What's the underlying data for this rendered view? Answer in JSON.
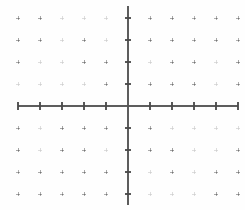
{
  "document": {
    "title": "Blank Cartesian Coordinate Grid",
    "kind": "coordinate-plane-worksheet"
  },
  "canvas": {
    "width": 245,
    "height": 210,
    "background_color": "#fefefe"
  },
  "chart_data": {
    "type": "scatter",
    "title": "",
    "subtitle": "",
    "xlabel": "",
    "ylabel": "",
    "series": [
      {
        "name": "plotted-points",
        "x": [],
        "y": []
      }
    ],
    "x": [],
    "values": [],
    "categories": [],
    "xlim": [
      -5,
      5
    ],
    "ylim": [
      -4,
      4
    ],
    "xticks": [
      -5,
      -4,
      -3,
      -2,
      -1,
      0,
      1,
      2,
      3,
      4,
      5
    ],
    "yticks": [
      -4,
      -3,
      -2,
      -1,
      0,
      1,
      2,
      3,
      4
    ],
    "xtick_labels": [],
    "ytick_labels": [],
    "grid": true,
    "grid_style": "dotted-plus-marks",
    "legend": false,
    "legend_position": "none",
    "annotations": [],
    "note": "Empty coordinate plane; no data series plotted."
  },
  "geometry": {
    "origin_x": 128,
    "origin_y": 106,
    "grid_spacing": 22,
    "grid_cols_left": 5,
    "grid_cols_right": 5,
    "grid_rows_up": 4,
    "grid_rows_down": 4,
    "x_axis_start": 18,
    "x_axis_end": 238,
    "y_axis_start": 6,
    "y_axis_end": 205,
    "tick_half_length_x": 4,
    "tick_half_length_y": 3,
    "dot_arm": 2
  },
  "colors": {
    "axis": "#555555",
    "tick": "#4a4a4a",
    "grid_dot": "#9a9a9a",
    "grid_dot_faint": "#c9c9c9",
    "background": "#fefefe"
  },
  "elements": {
    "x_axis_name": "Horizontal axis",
    "y_axis_name": "Vertical axis",
    "origin_name": "Origin",
    "grid_name": "Dotted grid"
  }
}
